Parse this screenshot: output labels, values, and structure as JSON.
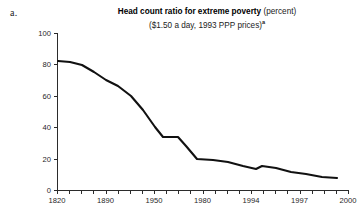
{
  "panel": {
    "label": "a."
  },
  "title": {
    "main": "Head count ratio for extreme poverty",
    "unit": "(percent)",
    "subtitle": "($1.50 a day, 1993 PPP prices)",
    "footnote_marker": "a"
  },
  "chart_data": {
    "type": "line",
    "title": "Head count ratio for extreme poverty (percent)",
    "subtitle": "($1.50 a day, 1993 PPP prices)",
    "xlabel": "",
    "ylabel": "",
    "ylim": [
      0,
      100
    ],
    "yticks": [
      0,
      20,
      40,
      60,
      80,
      100
    ],
    "ytick_labels": [
      "0",
      "20",
      "40",
      "60",
      "80",
      "100"
    ],
    "xtick_labels": [
      "1820",
      "1890",
      "1950",
      "1980",
      "1994",
      "1997",
      "2000"
    ],
    "xtick_label_positions": [
      0,
      4,
      8,
      12,
      16,
      20,
      24
    ],
    "minor_tick_count": 25,
    "grid": false,
    "legend": null,
    "series": [
      {
        "name": "Head count ratio for extreme poverty",
        "color": "#111111",
        "x": [
          0,
          1,
          2,
          3,
          4,
          5,
          6,
          7,
          8,
          9,
          10,
          11,
          12,
          13,
          14,
          15,
          16,
          17,
          18,
          19,
          20,
          21,
          22,
          23,
          24
        ],
        "values": [
          84,
          84,
          82,
          79,
          74,
          70,
          67,
          66,
          62,
          57,
          50,
          44,
          39,
          36,
          35,
          35,
          34,
          27,
          21,
          20,
          20,
          19,
          17,
          16,
          15
        ]
      }
    ],
    "points": [
      {
        "x": 1820,
        "y": 84
      },
      {
        "x": 1850,
        "y": 83
      },
      {
        "x": 1870,
        "y": 80
      },
      {
        "x": 1890,
        "y": 74
      },
      {
        "x": 1910,
        "y": 69
      },
      {
        "x": 1929,
        "y": 66
      },
      {
        "x": 1950,
        "y": 59
      },
      {
        "x": 1960,
        "y": 49
      },
      {
        "x": 1970,
        "y": 37
      },
      {
        "x": 1975,
        "y": 35
      },
      {
        "x": 1980,
        "y": 35
      },
      {
        "x": 1984,
        "y": 25
      },
      {
        "x": 1987,
        "y": 20
      },
      {
        "x": 1990,
        "y": 19
      },
      {
        "x": 1992,
        "y": 17
      },
      {
        "x": 1994,
        "y": 15
      },
      {
        "x": 1995,
        "y": 16
      },
      {
        "x": 1996,
        "y": 15
      },
      {
        "x": 1997,
        "y": 13
      },
      {
        "x": 1998,
        "y": 12
      },
      {
        "x": 1999,
        "y": 10
      },
      {
        "x": 2000,
        "y": 9
      }
    ],
    "path_px": "M 58,61 L 70,62 L 82,65 L 94,72 L 106,80 L 118,86 L 131,96 L 143,110 L 155,127 L 163,137 L 178,137 L 186,146 L 197,159 L 213,160 L 228,162 L 243,166 L 256,169 L 262,166 L 276,168 L 291,172 L 306,174 L 322,177 L 337,178",
    "axis_geometry": {
      "x_left_px": 57,
      "x_right_px": 348,
      "y_bottom_px": 190,
      "y_top_px": 33
    }
  }
}
